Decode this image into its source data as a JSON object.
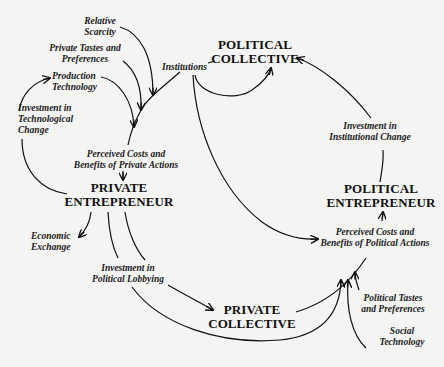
{
  "nodes": {
    "political_collective": {
      "line1": "POLITICAL",
      "line2": "COLLECTIVE"
    },
    "private_entrepreneur": {
      "line1": "PRIVATE",
      "line2": "ENTREPRENEUR"
    },
    "political_entrepreneur": {
      "line1": "POLITICAL",
      "line2": "ENTREPRENEUR"
    },
    "private_collective": {
      "line1": "PRIVATE",
      "line2": "COLLECTIVE"
    }
  },
  "labels": {
    "relative_scarcity": {
      "line1": "Relative",
      "line2": "Scarcity"
    },
    "private_tastes": {
      "line1": "Private Tastes and",
      "line2": "Preferences"
    },
    "production_technology": {
      "line1": "Production",
      "line2": "Technology"
    },
    "institutions": {
      "line1": "Institutions"
    },
    "investment_tech_change": {
      "line1": "Investment in",
      "line2": "Technological",
      "line3": "Change"
    },
    "perceived_private": {
      "line1": "Perceived Costs and",
      "line2": "Benefits of Private Actions"
    },
    "economic_exchange": {
      "line1": "Economic",
      "line2": "Exchange"
    },
    "investment_lobbying": {
      "line1": "Investment in",
      "line2": "Political Lobbying"
    },
    "investment_institutional": {
      "line1": "Investment in",
      "line2": "Institutional Change"
    },
    "perceived_political": {
      "line1": "Perceived Costs and",
      "line2": "Benefits of Political Actions"
    },
    "political_tastes": {
      "line1": "Political Tastes",
      "line2": "and Preferences"
    },
    "social_technology": {
      "line1": "Social",
      "line2": "Technology"
    }
  },
  "colors": {
    "background": "#f4f4f3",
    "ink": "#111111"
  }
}
